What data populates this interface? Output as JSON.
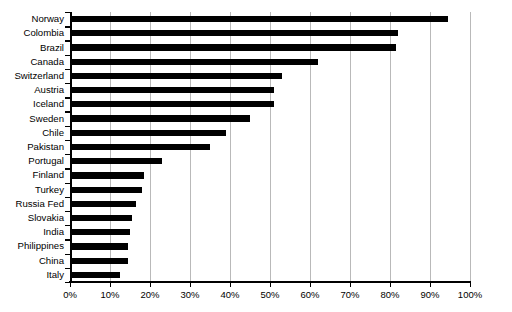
{
  "chart_data": {
    "type": "bar",
    "orientation": "horizontal",
    "title": "",
    "xlabel": "",
    "ylabel": "",
    "xlim": [
      0,
      100
    ],
    "xtick_labels": [
      "0%",
      "10%",
      "20%",
      "30%",
      "40%",
      "50%",
      "60%",
      "70%",
      "80%",
      "90%",
      "100%"
    ],
    "xtick_values": [
      0,
      10,
      20,
      30,
      40,
      50,
      60,
      70,
      80,
      90,
      100
    ],
    "grid": true,
    "grid_axis": "x",
    "legend": false,
    "bar_color": "#000000",
    "grid_color": "#b9b9b9",
    "categories": [
      "Norway",
      "Colombia",
      "Brazil",
      "Canada",
      "Switzerland",
      "Austria",
      "Iceland",
      "Sweden",
      "Chile",
      "Pakistan",
      "Portugal",
      "Finland",
      "Turkey",
      "Russia Fed",
      "Slovakia",
      "India",
      "Philippines",
      "China",
      "Italy"
    ],
    "values": [
      94.5,
      82,
      81.5,
      62,
      53,
      51,
      51,
      45,
      39,
      35,
      23,
      18.5,
      18,
      16.5,
      15.5,
      15,
      14.5,
      14.5,
      12.5
    ]
  }
}
